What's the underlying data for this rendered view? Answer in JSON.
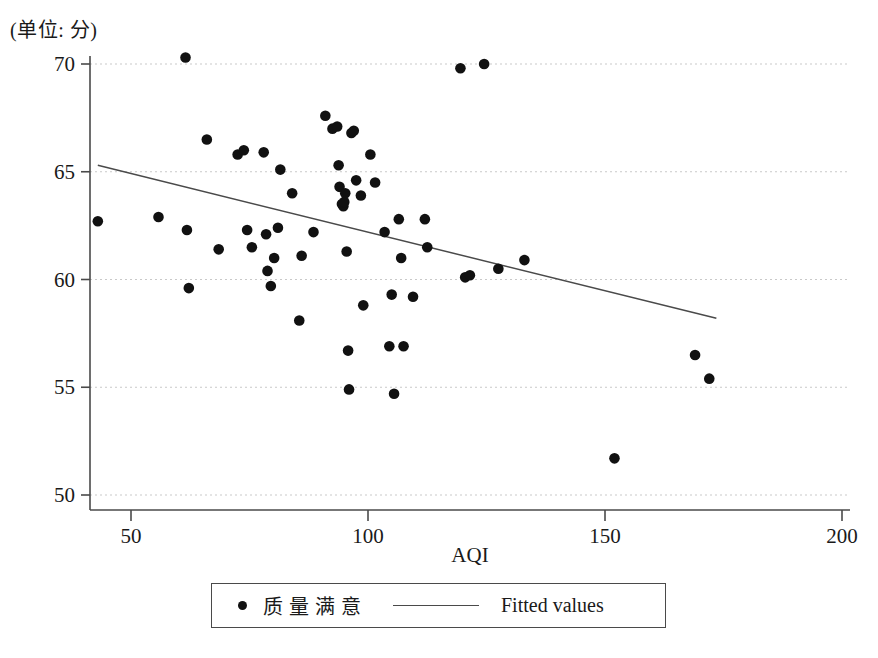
{
  "chart_data": {
    "type": "scatter",
    "title": "",
    "unit_note": "(单位: 分)",
    "xlabel": "AQI",
    "ylabel": "",
    "xlim": [
      42,
      207
    ],
    "ylim": [
      49.4,
      70.6
    ],
    "xticks": [
      50,
      100,
      150,
      200
    ],
    "yticks": [
      50,
      55,
      60,
      65,
      70
    ],
    "grid": "horizontal-dotted",
    "legend_position": "below-axis-center",
    "legend": [
      {
        "label": "质量满意",
        "marker": "dot",
        "color": "#111111"
      },
      {
        "label": "Fitted values",
        "marker": "line",
        "color": "#4a4a4a"
      }
    ],
    "series": [
      {
        "name": "质量满意",
        "marker": "dot",
        "color": "#111111",
        "points": [
          [
            43.0,
            62.7
          ],
          [
            55.8,
            62.9
          ],
          [
            61.5,
            70.3
          ],
          [
            61.8,
            62.3
          ],
          [
            62.2,
            59.6
          ],
          [
            66.0,
            66.5
          ],
          [
            68.5,
            61.4
          ],
          [
            72.5,
            65.8
          ],
          [
            73.8,
            66.0
          ],
          [
            74.5,
            62.3
          ],
          [
            75.5,
            61.5
          ],
          [
            78.0,
            65.9
          ],
          [
            78.5,
            62.1
          ],
          [
            78.8,
            60.4
          ],
          [
            79.5,
            59.7
          ],
          [
            80.2,
            61.0
          ],
          [
            81.0,
            62.4
          ],
          [
            81.5,
            65.1
          ],
          [
            84.0,
            64.0
          ],
          [
            85.5,
            58.1
          ],
          [
            86.0,
            61.1
          ],
          [
            88.5,
            62.2
          ],
          [
            91.0,
            67.6
          ],
          [
            92.5,
            67.0
          ],
          [
            93.5,
            67.1
          ],
          [
            93.8,
            65.3
          ],
          [
            94.0,
            64.3
          ],
          [
            94.5,
            63.5
          ],
          [
            94.8,
            63.4
          ],
          [
            95.0,
            63.6
          ],
          [
            95.2,
            64.0
          ],
          [
            95.5,
            61.3
          ],
          [
            95.8,
            56.7
          ],
          [
            96.0,
            54.9
          ],
          [
            96.5,
            66.8
          ],
          [
            97.0,
            66.9
          ],
          [
            97.5,
            64.6
          ],
          [
            98.5,
            63.9
          ],
          [
            99.0,
            58.8
          ],
          [
            100.5,
            65.8
          ],
          [
            101.5,
            64.5
          ],
          [
            103.5,
            62.2
          ],
          [
            104.5,
            56.9
          ],
          [
            105.0,
            59.3
          ],
          [
            105.5,
            54.7
          ],
          [
            106.5,
            62.8
          ],
          [
            107.0,
            61.0
          ],
          [
            107.5,
            56.9
          ],
          [
            109.5,
            59.2
          ],
          [
            112.0,
            62.8
          ],
          [
            112.5,
            61.5
          ],
          [
            119.5,
            69.8
          ],
          [
            120.5,
            60.1
          ],
          [
            121.5,
            60.2
          ],
          [
            124.5,
            70.0
          ],
          [
            127.5,
            60.5
          ],
          [
            133.0,
            60.9
          ],
          [
            152.0,
            51.7
          ],
          [
            169.0,
            56.5
          ],
          [
            172.0,
            55.4
          ]
        ]
      }
    ],
    "fit_line": {
      "name": "Fitted values",
      "color": "#4a4a4a",
      "x_start": 43.0,
      "y_start": 65.3,
      "x_end": 173.5,
      "y_end": 58.2
    }
  },
  "axes": {
    "x_title": "AQI",
    "y_tick_labels": [
      "70",
      "65",
      "60",
      "55",
      "50"
    ],
    "x_tick_labels": [
      "50",
      "100",
      "150",
      "200"
    ]
  }
}
